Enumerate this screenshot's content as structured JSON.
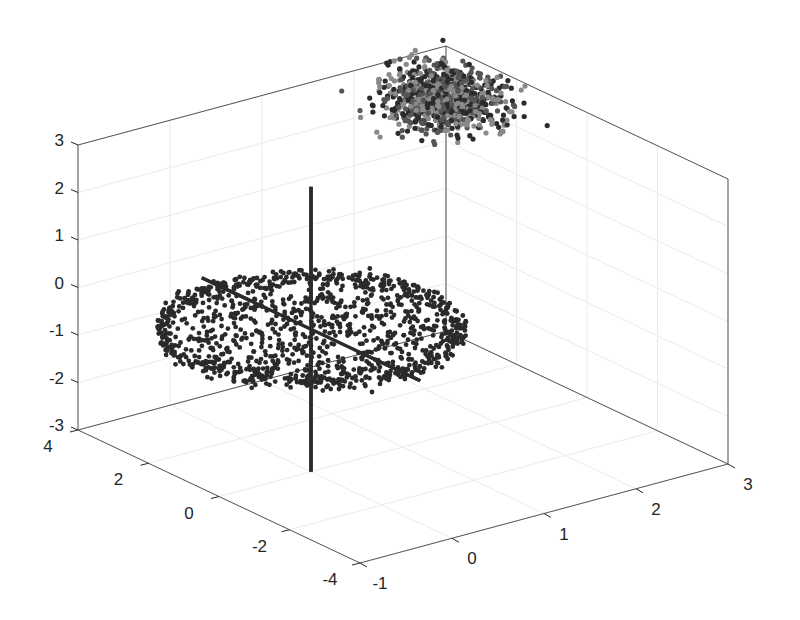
{
  "figure": {
    "background": "#ffffff",
    "axis_color": "#262626",
    "grid_color": "#ebebeb",
    "box_edge_color": "#555555"
  },
  "chart_data": {
    "type": "scatter3d",
    "title": "",
    "xlabel": "",
    "ylabel": "",
    "zlabel": "",
    "xlim": [
      -1,
      3
    ],
    "ylim": [
      -4,
      4
    ],
    "zlim": [
      -3,
      3
    ],
    "xticks": [
      -1,
      0,
      1,
      2,
      3
    ],
    "yticks": [
      -4,
      -2,
      0,
      2,
      4
    ],
    "zticks": [
      -3,
      -2,
      -1,
      0,
      1,
      2,
      3
    ],
    "xtick_labels": [
      "-1",
      "0",
      "1",
      "2",
      "3"
    ],
    "ytick_labels": [
      "-4",
      "-2",
      "0",
      "2",
      "4"
    ],
    "ztick_labels": [
      "-3",
      "-2",
      "-1",
      "0",
      "1",
      "2",
      "3"
    ],
    "grid": true,
    "legend": null,
    "series": [
      {
        "name": "disk points",
        "kind": "scatter",
        "shape": "filled ellipse disk in x-y plane, z ≈ 0",
        "center": [
          0,
          0,
          0
        ],
        "radii": [
          1.35,
          2.7
        ],
        "rotation_deg": 0,
        "z_spread": 0.08,
        "n_points": 1200,
        "edge_density": "higher near rim",
        "color": "#2a2a2a",
        "marker_size": 2.4
      },
      {
        "name": "cluster points",
        "kind": "scatter",
        "shape": "gaussian blob",
        "center": [
          2.2,
          2.0,
          3.0
        ],
        "std": [
          0.25,
          0.55,
          0.25
        ],
        "n_points": 900,
        "colors": [
          "#2b2b2b",
          "#8a8a8a",
          "#555555"
        ],
        "marker_size": 2.6
      },
      {
        "name": "z-axis line",
        "kind": "line",
        "from": [
          0,
          0,
          -3
        ],
        "to": [
          0,
          0,
          3
        ],
        "color": "#2b2b2b",
        "width": 3.5
      },
      {
        "name": "y-axis line",
        "kind": "line",
        "from": [
          0,
          3.1,
          0
        ],
        "to": [
          0,
          -3.1,
          0
        ],
        "color": "#2b2b2b",
        "width": 3.5
      }
    ],
    "view": {
      "origin_point": [
        -1,
        4,
        -3
      ],
      "origin_px": [
        78,
        430
      ],
      "px_per_x": [
        92,
        -24.75
      ],
      "px_per_y": [
        -35.25,
        -16.625
      ],
      "px_per_z": [
        0,
        -47.5
      ]
    }
  }
}
